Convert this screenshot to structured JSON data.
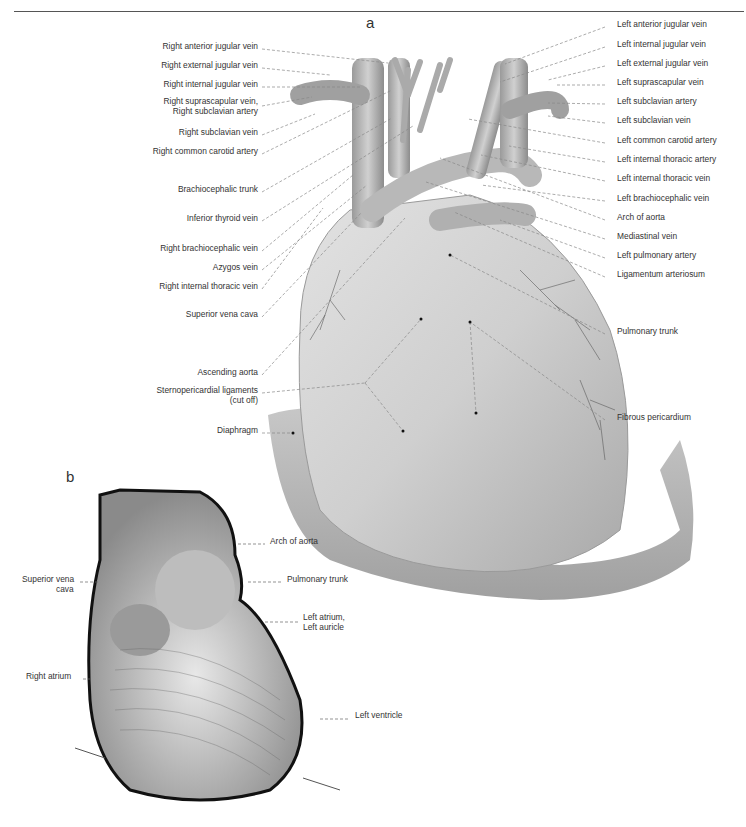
{
  "page": {
    "figure_a_letter": "a",
    "figure_b_letter": "b"
  },
  "figure_a": {
    "left_labels": [
      {
        "text": "Right anterior jugular vein",
        "y": 46
      },
      {
        "text": "Right external jugular vein",
        "y": 65
      },
      {
        "text": "Right internal jugular vein",
        "y": 84
      },
      {
        "text": "Right suprascapular vein,",
        "y": 101
      },
      {
        "text": "Right subclavian artery",
        "y": 111
      },
      {
        "text": "Right subclavian vein",
        "y": 132
      },
      {
        "text": "Right common carotid artery",
        "y": 151
      },
      {
        "text": "Brachiocephalic trunk",
        "y": 189
      },
      {
        "text": "Inferior thyroid vein",
        "y": 218
      },
      {
        "text": "Right brachiocephalic vein",
        "y": 248
      },
      {
        "text": "Azygos vein",
        "y": 267
      },
      {
        "text": "Right internal thoracic vein",
        "y": 286
      },
      {
        "text": "Superior vena cava",
        "y": 314
      },
      {
        "text": "Ascending aorta",
        "y": 372
      },
      {
        "text": "Sternopericardial ligaments",
        "y": 390
      },
      {
        "text": "(cut off)",
        "y": 400
      },
      {
        "text": "Diaphragm",
        "y": 430
      }
    ],
    "right_labels": [
      {
        "text": "Left anterior jugular vein",
        "y": 24
      },
      {
        "text": "Left internal jugular vein",
        "y": 44
      },
      {
        "text": "Left external jugular vein",
        "y": 63
      },
      {
        "text": "Left suprascapular vein",
        "y": 82
      },
      {
        "text": "Left subclavian artery",
        "y": 101
      },
      {
        "text": "Left subclavian vein",
        "y": 120
      },
      {
        "text": "Left common carotid artery",
        "y": 140
      },
      {
        "text": "Left internal thoracic artery",
        "y": 159
      },
      {
        "text": "Left internal thoracic vein",
        "y": 178
      },
      {
        "text": "Left brachiocephalic vein",
        "y": 198
      },
      {
        "text": "Arch of aorta",
        "y": 217
      },
      {
        "text": "Mediastinal vein",
        "y": 236
      },
      {
        "text": "Left pulmonary artery",
        "y": 255
      },
      {
        "text": "Ligamentum arteriosum",
        "y": 274
      },
      {
        "text": "Pulmonary trunk",
        "y": 331
      },
      {
        "text": "Fibrous pericardium",
        "y": 417
      }
    ]
  },
  "figure_b": {
    "labels": [
      {
        "text": "Arch of aorta",
        "x": 270,
        "y": 541
      },
      {
        "text": "Pulmonary trunk",
        "x": 287,
        "y": 579
      },
      {
        "text": "Left atrium,",
        "x": 303,
        "y": 617
      },
      {
        "text": "Left auricle",
        "x": 303,
        "y": 627
      },
      {
        "text": "Superior vena",
        "x": 22,
        "y": 579
      },
      {
        "text": "cava",
        "x": 56,
        "y": 589
      },
      {
        "text": "Right atrium",
        "x": 26,
        "y": 676
      },
      {
        "text": "Left ventricle",
        "x": 355,
        "y": 715
      }
    ]
  }
}
